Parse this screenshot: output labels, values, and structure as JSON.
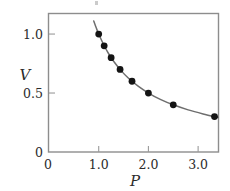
{
  "figure": {
    "background_color": "#ffffff",
    "frame_color": "#8d8d8d",
    "curve_color": "#6e6e6e",
    "marker_color": "#141414",
    "tick_color": "#9a9a9a",
    "text_color": "#2b2b2b"
  },
  "chart_data": {
    "type": "scatter",
    "title": "",
    "subtitle": "",
    "xlabel": "P",
    "ylabel": "V",
    "xlim": [
      0,
      3.4
    ],
    "ylim": [
      0,
      1.17
    ],
    "xticks": [
      0,
      1.0,
      2.0,
      3.0
    ],
    "xticklabels": [
      "0",
      "1.0",
      "2.0",
      "3.0"
    ],
    "yticks": [
      0,
      0.5,
      1.0
    ],
    "yticklabels": [
      "0",
      "0.5",
      "1.0"
    ],
    "grid": false,
    "legend": null,
    "legend_position": "none",
    "annotations": [],
    "series": [
      {
        "name": "measured data",
        "marker": "filled-circle",
        "x": [
          1.0,
          1.11,
          1.25,
          1.43,
          1.67,
          2.0,
          2.5,
          3.33
        ],
        "y": [
          1.0,
          0.9,
          0.8,
          0.7,
          0.6,
          0.5,
          0.4,
          0.3
        ]
      },
      {
        "name": "fitted curve PV = 1",
        "marker": "none",
        "x": [
          0.9,
          0.95,
          1.0,
          1.1,
          1.2,
          1.3,
          1.45,
          1.6,
          1.8,
          2.0,
          2.25,
          2.5,
          2.8,
          3.1,
          3.4
        ],
        "y": [
          1.111,
          1.053,
          1.0,
          0.909,
          0.833,
          0.769,
          0.69,
          0.625,
          0.556,
          0.5,
          0.444,
          0.4,
          0.357,
          0.323,
          0.294
        ]
      }
    ]
  }
}
